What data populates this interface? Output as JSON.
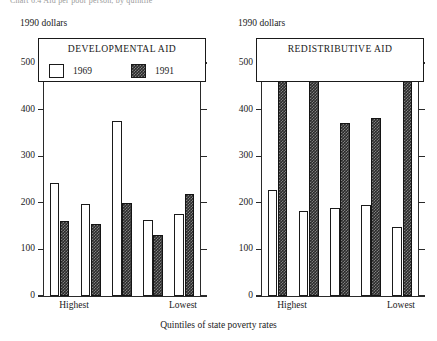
{
  "figure": {
    "top_caption": "Chart 6.4  Aid per poor person, by quintile",
    "xaxis_title": "Quintiles of state poverty rates",
    "units_label": "1990 dollars",
    "category_first_label": "Highest",
    "category_last_label": "Lowest",
    "accent_color": "#2b2b2b",
    "frame_color": "#1a1a1a"
  },
  "chart_data": [
    {
      "type": "bar",
      "title": "DEVELOPMENTAL AID",
      "xlabel": "Quintiles of state poverty rates",
      "ylabel": "1990 dollars",
      "ylim": [
        0,
        500
      ],
      "yticks": [
        0,
        100,
        200,
        300,
        400,
        500
      ],
      "ytick_labels": [
        "0",
        "100",
        "200",
        "300",
        "400",
        "500"
      ],
      "grid": false,
      "legend_position": "top-inside-box",
      "categories": [
        "Highest",
        "2",
        "3",
        "4",
        "Lowest"
      ],
      "series": [
        {
          "name": "1969",
          "values": [
            243,
            197,
            375,
            163,
            175
          ]
        },
        {
          "name": "1991",
          "values": [
            160,
            155,
            200,
            130,
            219
          ]
        }
      ]
    },
    {
      "type": "bar",
      "title": "REDISTRIBUTIVE AID",
      "xlabel": "Quintiles of state poverty rates",
      "ylabel": "1990 dollars",
      "ylim": [
        0,
        500
      ],
      "yticks": [
        0,
        100,
        200,
        300,
        400,
        500
      ],
      "ytick_labels": [
        "0",
        "100",
        "200",
        "300",
        "400",
        "500"
      ],
      "grid": false,
      "legend_position": "none",
      "categories": [
        "Highest",
        "2",
        "3",
        "4",
        "Lowest"
      ],
      "series": [
        {
          "name": "1969",
          "values": [
            228,
            182,
            188,
            195,
            148
          ]
        },
        {
          "name": "1991",
          "values": [
            475,
            470,
            372,
            382,
            477
          ]
        }
      ]
    }
  ]
}
